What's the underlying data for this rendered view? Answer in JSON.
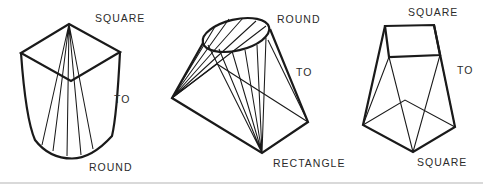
{
  "colors": {
    "background": "#ffffff",
    "line_ink": "#1a1a1a",
    "label_text": "#2b2b2b",
    "page_edge_line": "#d9d9d9"
  },
  "figures": [
    {
      "name": "square-to-round",
      "label_top": "SQUARE",
      "label_mid": "TO",
      "label_bottom": "ROUND"
    },
    {
      "name": "round-to-rectangle",
      "label_top": "ROUND",
      "label_mid": "TO",
      "label_bottom": "RECTANGLE"
    },
    {
      "name": "square-to-square",
      "label_top": "SQUARE",
      "label_mid": "TO",
      "label_bottom": "SQUARE"
    }
  ]
}
